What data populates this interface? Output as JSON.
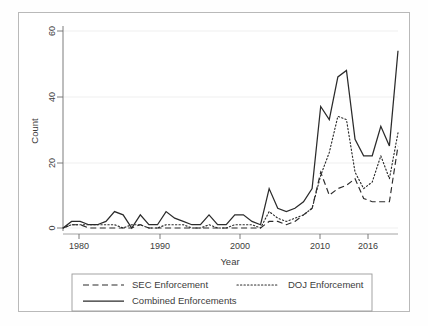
{
  "chart_data": {
    "type": "line",
    "title": "",
    "xlabel": "Year",
    "ylabel": "Count",
    "xlim": [
      1977,
      2016
    ],
    "ylim": [
      0,
      62
    ],
    "xticks": [
      1980,
      1990,
      2000,
      2010,
      2016
    ],
    "yticks": [
      0,
      20,
      40,
      60
    ],
    "grid": "horizontal",
    "legend_position": "bottom",
    "x": [
      1977,
      1978,
      1979,
      1980,
      1981,
      1982,
      1983,
      1984,
      1985,
      1986,
      1987,
      1988,
      1989,
      1990,
      1991,
      1992,
      1993,
      1994,
      1995,
      1996,
      1997,
      1998,
      1999,
      2000,
      2001,
      2002,
      2003,
      2004,
      2005,
      2006,
      2007,
      2008,
      2009,
      2010,
      2011,
      2012,
      2013,
      2014,
      2015,
      2016
    ],
    "series": [
      {
        "name": "SEC Enforcement",
        "style": "dashed",
        "color": "#2b2b2b",
        "values": [
          0,
          1,
          1,
          0,
          0,
          0,
          0,
          0,
          0,
          1,
          0,
          0,
          0,
          0,
          0,
          0,
          0,
          0,
          0,
          0,
          0,
          0,
          0,
          0,
          2,
          2,
          1,
          2,
          4,
          6,
          17,
          10,
          12,
          13,
          15,
          9,
          8,
          8,
          8,
          25
        ]
      },
      {
        "name": "DOJ Enforcement",
        "style": "dotted",
        "color": "#2b2b2b",
        "values": [
          0,
          1,
          1,
          1,
          1,
          1,
          1,
          0,
          1,
          1,
          0,
          0,
          1,
          1,
          1,
          0,
          0,
          1,
          0,
          0,
          1,
          1,
          1,
          0,
          5,
          3,
          2,
          3,
          4,
          6,
          16,
          23,
          34,
          33,
          17,
          12,
          14,
          22,
          15,
          29
        ]
      },
      {
        "name": "Combined Enforcements",
        "style": "solid",
        "color": "#2b2b2b",
        "values": [
          0,
          2,
          2,
          1,
          1,
          2,
          5,
          4,
          0,
          4,
          1,
          1,
          5,
          3,
          2,
          1,
          1,
          4,
          1,
          1,
          4,
          4,
          2,
          1,
          12,
          6,
          5,
          6,
          8,
          12,
          37,
          33,
          46,
          48,
          27,
          22,
          22,
          31,
          25,
          54
        ]
      }
    ]
  },
  "axes": {
    "ylabel": "Count",
    "xlabel": "Year",
    "ytick_labels": [
      "0",
      "20",
      "40",
      "60"
    ],
    "xtick_labels": [
      "1980",
      "1990",
      "2000",
      "2010",
      "2016"
    ]
  },
  "legend": {
    "entries": [
      {
        "label": "SEC Enforcement",
        "style": "dashed"
      },
      {
        "label": "DOJ Enforcement",
        "style": "dotted"
      },
      {
        "label": "Combined Enforcements",
        "style": "solid"
      }
    ]
  }
}
